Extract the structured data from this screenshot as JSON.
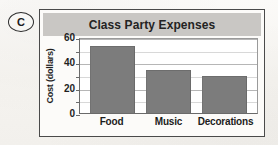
{
  "part_label": "C",
  "chart_data": {
    "type": "bar",
    "title": "Class Party Expenses",
    "xlabel": "",
    "ylabel": "Cost (dollars)",
    "categories": [
      "Food",
      "Music",
      "Decorations"
    ],
    "values": [
      53,
      34,
      29
    ],
    "ylim": [
      0,
      60
    ],
    "ytick_labels": [
      "60",
      "40",
      "20",
      "0"
    ],
    "ytick_values": [
      60,
      40,
      20,
      0
    ],
    "minor_tick_values": [
      50,
      30,
      10
    ],
    "grid": true,
    "legend": "none",
    "bar_color": "#7c7c7c",
    "title_band_color": "#c9c7c4",
    "plot_background": "#ffffff",
    "frame_color": "#4a4a4a"
  }
}
